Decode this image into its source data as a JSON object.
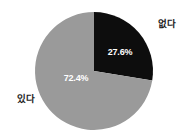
{
  "chart_data": {
    "type": "pie",
    "title": "",
    "subtitle": "",
    "xlabel": "",
    "ylabel": "",
    "legend_position": "none",
    "grid": false,
    "labels_outside": true,
    "start_angle_deg": 0,
    "direction": "clockwise",
    "categories": [
      "없다",
      "있다"
    ],
    "values": [
      27.6,
      72.4
    ],
    "value_labels": [
      "27.6%",
      "72.4%"
    ],
    "colors": [
      "#0d0d0d",
      "#9a9a9a"
    ],
    "background_color": "#ffffff",
    "value_label_color": "#ffffff",
    "category_label_color": "#1a1a1a",
    "slices": [
      {
        "name": "없다",
        "value": 27.6,
        "value_label": "27.6%",
        "color": "#0d0d0d",
        "start_angle_deg": 0,
        "end_angle_deg": 99.36
      },
      {
        "name": "있다",
        "value": 72.4,
        "value_label": "72.4%",
        "color": "#9a9a9a",
        "start_angle_deg": 99.36,
        "end_angle_deg": 360
      }
    ]
  },
  "geometry": {
    "center_x": 94,
    "center_y": 71,
    "radius": 59
  }
}
